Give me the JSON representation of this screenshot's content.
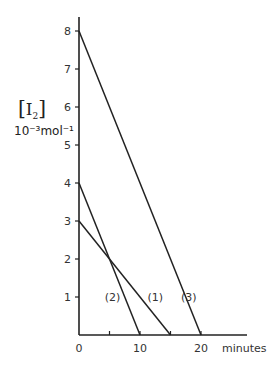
{
  "chart_data": {
    "type": "line",
    "title": "",
    "xlabel": "minutes",
    "ylabel": "[I2]",
    "ylabel_units": "10⁻³mol⁻¹",
    "xlim": [
      0,
      27
    ],
    "ylim": [
      0,
      8.5
    ],
    "x_ticks": [
      0,
      5,
      10,
      15,
      20
    ],
    "x_tick_labels": [
      "0",
      "",
      "10",
      "",
      "20"
    ],
    "y_ticks": [
      1,
      2,
      3,
      4,
      5,
      6,
      7,
      8
    ],
    "y_tick_labels": [
      "1",
      "2",
      "3",
      "4",
      "5",
      "6",
      "7",
      "8"
    ],
    "grid": false,
    "legend": "inline labels",
    "series": [
      {
        "name": "(1)",
        "x": [
          0,
          15
        ],
        "y": [
          3,
          0
        ],
        "label_pos": [
          12.5,
          1
        ]
      },
      {
        "name": "(2)",
        "x": [
          0,
          10
        ],
        "y": [
          4,
          0
        ],
        "label_pos": [
          5.5,
          1
        ]
      },
      {
        "name": "(3)",
        "x": [
          0,
          20
        ],
        "y": [
          8,
          0
        ],
        "label_pos": [
          18,
          1
        ]
      }
    ]
  },
  "labels": {
    "y_title_main": "I",
    "y_title_sub": "2",
    "y_units": "10⁻³mol⁻¹",
    "x_title": "minutes",
    "origin": "0"
  }
}
